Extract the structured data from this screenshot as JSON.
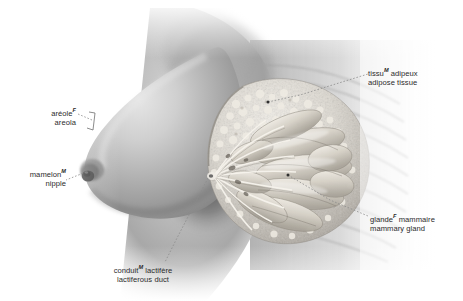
{
  "figure": {
    "background_color": "#ffffff",
    "text_color": "#2b2b2b",
    "leader_color": "#8c8c8c",
    "style": "grayscale airbrush anatomical illustration"
  },
  "labels": [
    {
      "id": "adipose-tissue",
      "fr_term": "tissu",
      "fr_gender": "M",
      "fr_rest": " adipeux",
      "en": "adipose tissue",
      "align": "right"
    },
    {
      "id": "mammary-gland",
      "fr_term": "glande",
      "fr_gender": "F",
      "fr_rest": " mammaire",
      "en": "mammary gland",
      "align": "right"
    },
    {
      "id": "areola",
      "fr_term": "aréole",
      "fr_gender": "F",
      "fr_rest": "",
      "en": "areola",
      "align": "left"
    },
    {
      "id": "nipple",
      "fr_term": "mamelon",
      "fr_gender": "M",
      "fr_rest": "",
      "en": "nipple",
      "align": "left"
    },
    {
      "id": "lactiferous-duct",
      "fr_term": "conduit",
      "fr_gender": "M",
      "fr_rest": " lactifère",
      "en": "lactiferous duct",
      "align": "center"
    }
  ]
}
